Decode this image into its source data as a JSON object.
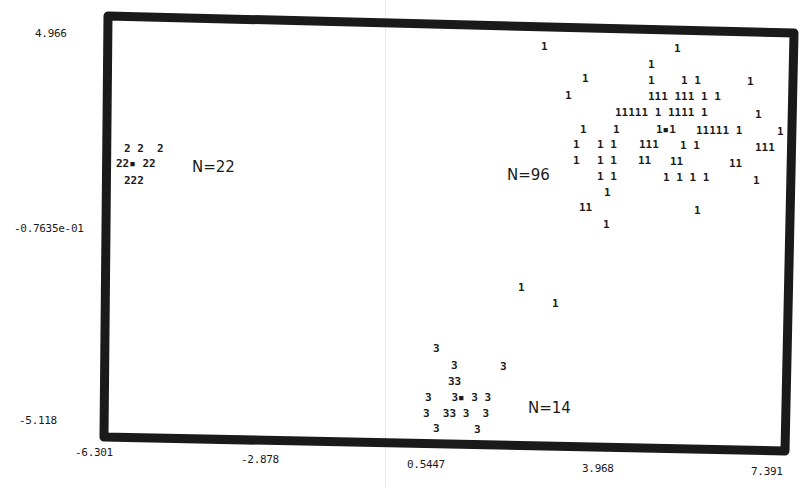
{
  "chart_data": {
    "type": "scatter",
    "title": "",
    "xlabel": "",
    "ylabel": "",
    "xlim": [
      -6.301,
      7.391
    ],
    "ylim": [
      -5.118,
      4.966
    ],
    "grid": false,
    "legend": "none",
    "x_ticks": [
      "-6.301",
      "-2.878",
      "0.5447",
      "3.968",
      "7.391"
    ],
    "y_ticks": [
      "4.966",
      "-0.7635e-01",
      "-5.118"
    ],
    "clusters": [
      {
        "label": "1",
        "n_label": "N=96",
        "n": 96,
        "centroid": [
          4.7,
          2.4
        ]
      },
      {
        "label": "2",
        "n_label": "N=22",
        "n": 22,
        "centroid": [
          -5.6,
          1.8
        ]
      },
      {
        "label": "3",
        "n_label": "N=14",
        "n": 14,
        "centroid": [
          1.4,
          -4.5
        ]
      }
    ],
    "marker_rows": [
      {
        "cluster": "1",
        "text": "1",
        "px": 541,
        "py": 41
      },
      {
        "cluster": "1",
        "text": "1",
        "px": 674,
        "py": 43
      },
      {
        "cluster": "1",
        "text": "1",
        "px": 648,
        "py": 59
      },
      {
        "cluster": "1",
        "text": "1",
        "px": 582,
        "py": 73
      },
      {
        "cluster": "1",
        "text": "1",
        "px": 648,
        "py": 75
      },
      {
        "cluster": "1",
        "text": "1 1",
        "px": 681,
        "py": 75
      },
      {
        "cluster": "1",
        "text": "1",
        "px": 747,
        "py": 76
      },
      {
        "cluster": "1",
        "text": "1",
        "px": 565,
        "py": 90
      },
      {
        "cluster": "1",
        "text": "111 111 1 1",
        "px": 648,
        "py": 91
      },
      {
        "cluster": "1",
        "text": "11111 1 1111 1",
        "px": 615,
        "py": 107
      },
      {
        "cluster": "1",
        "text": "1",
        "px": 755,
        "py": 109
      },
      {
        "cluster": "1",
        "text": "1",
        "px": 580,
        "py": 124
      },
      {
        "cluster": "1",
        "text": "1",
        "px": 613,
        "py": 124
      },
      {
        "cluster": "1",
        "text": "1▪1",
        "px": 656,
        "py": 124
      },
      {
        "cluster": "1",
        "text": "11111 1",
        "px": 696,
        "py": 125
      },
      {
        "cluster": "1",
        "text": "1",
        "px": 777,
        "py": 126
      },
      {
        "cluster": "1",
        "text": "1",
        "px": 573,
        "py": 139
      },
      {
        "cluster": "1",
        "text": "1 1",
        "px": 597,
        "py": 139
      },
      {
        "cluster": "1",
        "text": "111",
        "px": 639,
        "py": 139
      },
      {
        "cluster": "1",
        "text": "1 1",
        "px": 680,
        "py": 140
      },
      {
        "cluster": "1",
        "text": "111",
        "px": 755,
        "py": 142
      },
      {
        "cluster": "1",
        "text": "1",
        "px": 573,
        "py": 155
      },
      {
        "cluster": "1",
        "text": "1 1",
        "px": 597,
        "py": 155
      },
      {
        "cluster": "1",
        "text": "11",
        "px": 638,
        "py": 155
      },
      {
        "cluster": "1",
        "text": "11",
        "px": 670,
        "py": 156
      },
      {
        "cluster": "1",
        "text": "11",
        "px": 729,
        "py": 158
      },
      {
        "cluster": "1",
        "text": "1 1",
        "px": 597,
        "py": 171
      },
      {
        "cluster": "1",
        "text": "1 1 1 1",
        "px": 663,
        "py": 172
      },
      {
        "cluster": "1",
        "text": "1",
        "px": 753,
        "py": 175
      },
      {
        "cluster": "1",
        "text": "1",
        "px": 604,
        "py": 187
      },
      {
        "cluster": "1",
        "text": "11",
        "px": 579,
        "py": 202
      },
      {
        "cluster": "1",
        "text": "1",
        "px": 694,
        "py": 205
      },
      {
        "cluster": "1",
        "text": "1",
        "px": 603,
        "py": 219
      },
      {
        "cluster": "1",
        "text": "1",
        "px": 518,
        "py": 282
      },
      {
        "cluster": "1",
        "text": "1",
        "px": 552,
        "py": 298
      },
      {
        "cluster": "2",
        "text": "2 2  2",
        "px": 124,
        "py": 143
      },
      {
        "cluster": "2",
        "text": "22▪ 22",
        "px": 116,
        "py": 158
      },
      {
        "cluster": "2",
        "text": "222",
        "px": 124,
        "py": 175
      },
      {
        "cluster": "3",
        "text": "3",
        "px": 433,
        "py": 343
      },
      {
        "cluster": "3",
        "text": "3",
        "px": 451,
        "py": 360
      },
      {
        "cluster": "3",
        "text": "3",
        "px": 500,
        "py": 361
      },
      {
        "cluster": "3",
        "text": "33",
        "px": 448,
        "py": 376
      },
      {
        "cluster": "3",
        "text": "3   3▪ 3 3",
        "px": 425,
        "py": 392
      },
      {
        "cluster": "3",
        "text": "3  33 3  3",
        "px": 423,
        "py": 408
      },
      {
        "cluster": "3",
        "text": "3",
        "px": 433,
        "py": 423
      },
      {
        "cluster": "3",
        "text": "3",
        "px": 474,
        "py": 424
      }
    ],
    "n_labels": [
      {
        "text": "N=22",
        "px": 192,
        "py": 158
      },
      {
        "text": "N=96",
        "px": 507,
        "py": 166
      },
      {
        "text": "N=14",
        "px": 528,
        "py": 399
      }
    ],
    "tick_positions": {
      "x": [
        {
          "text": "-6.301",
          "px": 75,
          "py": 446
        },
        {
          "text": "-2.878",
          "px": 241,
          "py": 453
        },
        {
          "text": "0.5447",
          "px": 407,
          "py": 458
        },
        {
          "text": "3.968",
          "px": 582,
          "py": 462
        },
        {
          "text": "7.391",
          "px": 751,
          "py": 465
        }
      ],
      "y": [
        {
          "text": "4.966",
          "px": 35,
          "py": 27
        },
        {
          "text": "-0.7635e-01",
          "px": 14,
          "py": 222
        },
        {
          "text": "-5.118",
          "px": 19,
          "py": 414
        }
      ]
    },
    "colors": {
      "ink": "#1a1a1a",
      "background": "#ffffff",
      "scan_artifact": "#e8e8e8"
    }
  }
}
